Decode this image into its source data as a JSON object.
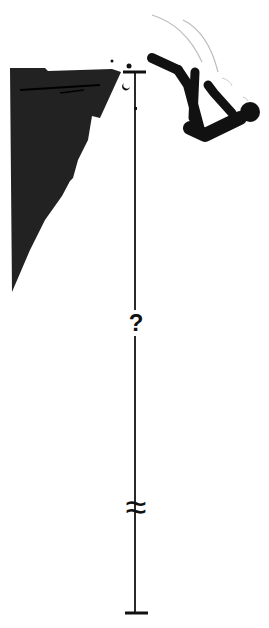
{
  "diagram": {
    "height_label": "?",
    "break_symbol": "≈",
    "colors": {
      "silhouette": "#111111",
      "cliff": "#222222",
      "line": "#111111",
      "motion_lines": "#bbbbbb",
      "background": "#ffffff"
    }
  }
}
